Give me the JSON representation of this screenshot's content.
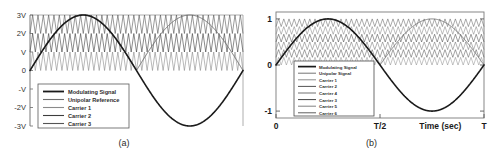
{
  "figure": {
    "background": "#ffffff",
    "panels": [
      {
        "id": "a",
        "caption": "(a)"
      },
      {
        "id": "b",
        "caption": "(b)"
      }
    ]
  },
  "chart_data": [
    {
      "type": "line",
      "panel": "a",
      "title": "",
      "xlabel": "",
      "ylabel": "",
      "xlim": [
        0,
        1
      ],
      "ylim": [
        -3,
        3
      ],
      "grid": false,
      "legend_position": "lower-left-inside",
      "yticks": [
        "3V",
        "2V",
        "V",
        "0",
        "-V",
        "-2V",
        "-3V"
      ],
      "ytick_values": [
        3,
        2,
        1,
        0,
        -1,
        -2,
        -3
      ],
      "xticks": [],
      "series": [
        {
          "name": "Modulating Signal",
          "kind": "sine",
          "amplitude": 3,
          "cycles": 1,
          "color": "#1a1a1a",
          "width": 1.6
        },
        {
          "name": "Unipolar Reference",
          "kind": "rectified-sine",
          "amplitude": 3,
          "cycles": 1,
          "color": "#6e6e6e",
          "width": 1.0
        },
        {
          "name": "Carrier 1",
          "kind": "triangle",
          "band": [
            0,
            1
          ],
          "periods": 40,
          "color": "#8a8a8a",
          "width": 0.6
        },
        {
          "name": "Carrier 2",
          "kind": "triangle",
          "band": [
            1,
            2
          ],
          "periods": 40,
          "color": "#3d3d3d",
          "width": 0.6
        },
        {
          "name": "Carrier 3",
          "kind": "triangle",
          "band": [
            2,
            3
          ],
          "periods": 40,
          "color": "#555555",
          "width": 0.6
        }
      ]
    },
    {
      "type": "line",
      "panel": "b",
      "title": "",
      "xlabel": "Time (sec)",
      "ylabel": "",
      "xlim": [
        0,
        1
      ],
      "ylim": [
        -1.15,
        1.15
      ],
      "grid": false,
      "legend_position": "lower-left-inside",
      "yticks": [
        "1",
        "0",
        "-1"
      ],
      "ytick_values": [
        1,
        0,
        -1
      ],
      "xticks": [
        "0",
        "T/2",
        "T"
      ],
      "xtick_values": [
        0,
        0.5,
        1
      ],
      "series": [
        {
          "name": "Modulating Signal",
          "kind": "sine",
          "amplitude": 1,
          "cycles": 1,
          "color": "#1a1a1a",
          "width": 1.6
        },
        {
          "name": "Unipolar Signal",
          "kind": "rectified-sine",
          "amplitude": 1,
          "cycles": 1,
          "color": "#6e6e6e",
          "width": 0.9
        },
        {
          "name": "Carrier 1",
          "kind": "triangle",
          "band": [
            0,
            0.16667
          ],
          "periods": 40,
          "color": "#888888",
          "width": 0.5
        },
        {
          "name": "Carrier 2",
          "kind": "triangle",
          "band": [
            0.16667,
            0.33333
          ],
          "periods": 40,
          "color": "#4a4a4a",
          "width": 0.5
        },
        {
          "name": "Carrier 4",
          "kind": "triangle",
          "band": [
            0.33333,
            0.5
          ],
          "periods": 40,
          "color": "#6a6a6a",
          "width": 0.5
        },
        {
          "name": "Carrier 3",
          "kind": "triangle",
          "band": [
            0.5,
            0.66667
          ],
          "periods": 40,
          "color": "#3a3a3a",
          "width": 0.5
        },
        {
          "name": "Carrier 5",
          "kind": "triangle",
          "band": [
            0.66667,
            0.83333
          ],
          "periods": 40,
          "color": "#7a7a7a",
          "width": 0.5
        },
        {
          "name": "Carrier 6",
          "kind": "triangle",
          "band": [
            0.83333,
            1.0
          ],
          "periods": 40,
          "color": "#565656",
          "width": 0.5
        }
      ]
    }
  ]
}
